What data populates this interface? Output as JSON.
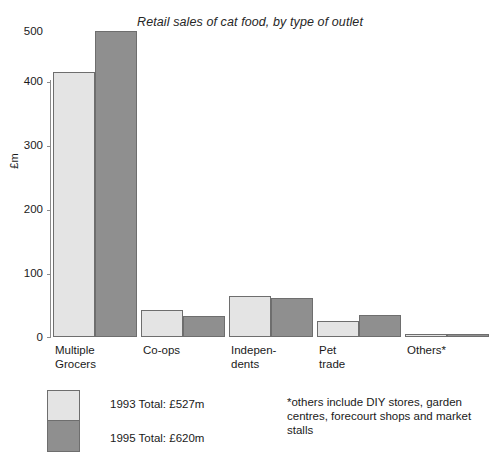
{
  "chart_data": {
    "type": "bar",
    "title": "Retail sales of cat food, by type of outlet",
    "xlabel": "",
    "ylabel": "£m",
    "ylim": [
      0,
      500
    ],
    "yticks": [
      0,
      100,
      200,
      300,
      400,
      500
    ],
    "ytick_labels": [
      "0",
      "100",
      "200",
      "300",
      "400",
      "500"
    ],
    "grid": false,
    "legend_position": "bottom-left",
    "categories": [
      "Multiple\nGrocers",
      "Co-ops",
      "Indepen-\ndents",
      "Pet\ntrade",
      "Others*"
    ],
    "series": [
      {
        "name": "1993 Total: £527m",
        "year": "1993",
        "color": "#e4e4e4",
        "values": [
          416,
          42,
          64,
          25,
          4
        ]
      },
      {
        "name": "1995 Total: £620m",
        "year": "1995",
        "color": "#8f8f8f",
        "values": [
          480,
          33,
          61,
          35,
          4
        ]
      }
    ],
    "annotations": [
      "*others include DIY stores, garden centres, forecourt shops and market stalls"
    ]
  },
  "axis": {
    "y_title": "£m",
    "tick_500": "500",
    "tick_400": "400",
    "tick_300": "300",
    "tick_200": "200",
    "tick_100": "100",
    "tick_0": "0"
  },
  "categories": {
    "c0": "Multiple\nGrocers",
    "c1": "Co-ops",
    "c2": "Indepen-\ndents",
    "c3": "Pet\ntrade",
    "c4": "Others*"
  },
  "legend": {
    "label_1993": "1993 Total: £527m",
    "label_1995": "1995 Total: £620m"
  },
  "footnote": {
    "text": "*others include DIY stores, garden centres, forecourt shops and market stalls"
  }
}
